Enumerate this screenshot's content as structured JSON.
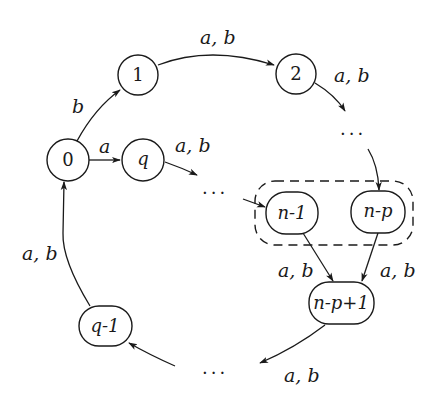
{
  "diagram": {
    "type": "automaton",
    "nodes": {
      "n0": {
        "label": "0"
      },
      "n1": {
        "label": "1"
      },
      "n2": {
        "label": "2"
      },
      "nq": {
        "label": "q"
      },
      "nn1": {
        "label": "n-1"
      },
      "nnp": {
        "label": "n-p"
      },
      "nnp1": {
        "label": "n-p+1"
      },
      "nq1": {
        "label": "q-1"
      }
    },
    "ellipses": {
      "top_right": "...",
      "middle": "...",
      "bottom": "..."
    },
    "edge_labels": {
      "e0_1": "b",
      "e0_q": "a",
      "e1_2": "a, b",
      "e2_dots": "a, b",
      "eq_dots": "a, b",
      "en1_np1": "a, b",
      "enp_np1": "a, b",
      "enp1_dots": "a, b",
      "eq1_0": "a, b"
    },
    "group": {
      "description": "dashed box grouping n-1 and n-p"
    }
  }
}
